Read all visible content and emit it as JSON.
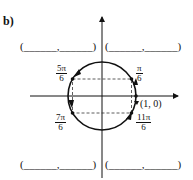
{
  "part_label": "b)",
  "angles": [
    {
      "id": "pi6",
      "num": "π",
      "den": "6"
    },
    {
      "id": "5pi6",
      "num": "5π",
      "den": "6"
    },
    {
      "id": "7pi6",
      "num": "7π",
      "den": "6"
    },
    {
      "id": "11pi6",
      "num": "11π",
      "den": "6"
    }
  ],
  "point_label": "(1, 0)",
  "blanks": {
    "top_left": "(______,______)",
    "top_right": "(______,______)",
    "bottom_left": "(______,______)",
    "bottom_right": "(______,______)"
  }
}
